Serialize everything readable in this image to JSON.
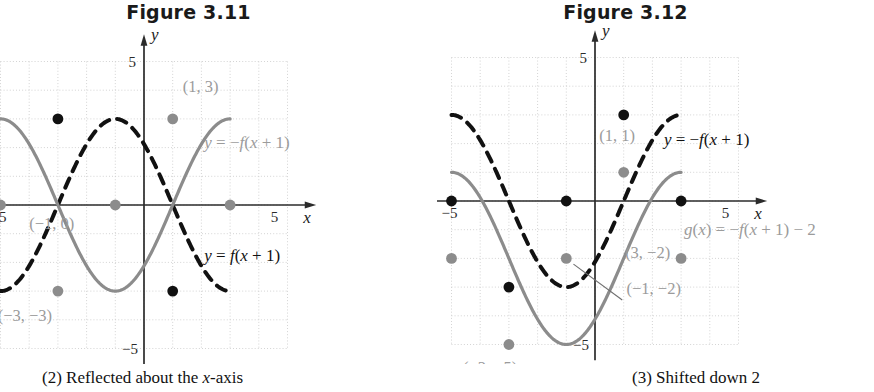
{
  "figures": [
    {
      "title": "Figure 3.11",
      "caption_prefix": "(2) Reflected about the ",
      "caption_italic": "x",
      "caption_suffix": "-axis",
      "axis": {
        "x_label": "x",
        "y_label": "y",
        "x_tick_neg": "−5",
        "x_tick_pos": "5",
        "y_tick_pos": "5",
        "y_tick_neg": "−5",
        "xmin": -6,
        "xmax": 6,
        "ymin": -6,
        "ymax": 6
      },
      "point_labels": [
        {
          "text": "(1, 3)",
          "color": "#9b9b9b",
          "x": 1.35,
          "y": 3.95
        },
        {
          "text": "(−1, 0)",
          "color": "#9b9b9b",
          "x": -4.0,
          "y": -0.85
        },
        {
          "text": "(−3, −3)",
          "color": "#9b9b9b",
          "x": -5.1,
          "y": -4.05
        }
      ],
      "equation_labels": [
        {
          "text": "y = −f(x + 1)",
          "color": "#9b9b9b",
          "x": 2.1,
          "y": 2.0
        },
        {
          "text": "y = f(x + 1)",
          "color": "#111111",
          "x": 2.1,
          "y": -1.95
        }
      ],
      "curves": [
        {
          "name": "dashed-black-curve",
          "style": "dashed",
          "color": "#111111",
          "amplitude": 3,
          "period": 8,
          "phase": -3,
          "sign": 1
        },
        {
          "name": "solid-gray-curve",
          "style": "solid",
          "color": "#8c8c8c",
          "amplitude": 3,
          "period": 8,
          "phase": -3,
          "sign": -1
        }
      ],
      "markers": [
        {
          "x": -3,
          "y": 3,
          "color": "#111111"
        },
        {
          "x": 1,
          "y": -3,
          "color": "#111111"
        },
        {
          "x": -5,
          "y": 0,
          "color": "#8c8c8c"
        },
        {
          "x": -1,
          "y": 0,
          "color": "#8c8c8c"
        },
        {
          "x": 3,
          "y": 0,
          "color": "#8c8c8c"
        },
        {
          "x": 1,
          "y": 3,
          "color": "#8c8c8c"
        },
        {
          "x": -3,
          "y": -3,
          "color": "#8c8c8c"
        }
      ]
    },
    {
      "title": "Figure 3.12",
      "caption_prefix": "(3) Shifted down 2",
      "caption_italic": "",
      "caption_suffix": "",
      "axis": {
        "x_label": "x",
        "y_label": "y",
        "x_tick_neg": "−5",
        "x_tick_pos": "5",
        "y_tick_pos": "5",
        "y_tick_neg": "−5",
        "xmin": -6,
        "xmax": 6,
        "ymin": -6,
        "ymax": 6
      },
      "point_labels": [
        {
          "text": "(1, 1)",
          "color": "#9b9b9b",
          "x": 0.15,
          "y": 2.1
        },
        {
          "text": "(3, −2)",
          "color": "#9b9b9b",
          "x": 1.05,
          "y": -2.0
        },
        {
          "text": "(−1, −2)",
          "color": "#9b9b9b",
          "x": 1.1,
          "y": -3.25
        },
        {
          "text": "(−5, −2)",
          "color": "#9b9b9b",
          "x": -7.6,
          "y": -2.65
        },
        {
          "text": "(−3, −5)",
          "color": "#9b9b9b",
          "x": -4.6,
          "y": -6.0
        }
      ],
      "equation_labels": [
        {
          "text": "y = −f(x + 1)",
          "color": "#111111",
          "x": 2.4,
          "y": 1.95
        },
        {
          "text": "g(x) = −f(x + 1) − 2",
          "color": "#9b9b9b",
          "x": 3.1,
          "y": -1.2
        }
      ],
      "curves": [
        {
          "name": "dashed-black-curve",
          "style": "dashed",
          "color": "#111111",
          "amplitude": 3,
          "period": 8,
          "phase": -3,
          "sign": -1,
          "offset": 0
        },
        {
          "name": "solid-gray-curve",
          "style": "solid",
          "color": "#8c8c8c",
          "amplitude": 3,
          "period": 8,
          "phase": -3,
          "sign": -1,
          "offset": -2
        }
      ],
      "markers": [
        {
          "x": -5,
          "y": 0,
          "color": "#111111"
        },
        {
          "x": -1,
          "y": 0,
          "color": "#111111"
        },
        {
          "x": 3,
          "y": 0,
          "color": "#111111"
        },
        {
          "x": 1,
          "y": 3,
          "color": "#111111"
        },
        {
          "x": -3,
          "y": -3,
          "color": "#111111"
        },
        {
          "x": -5,
          "y": -2,
          "color": "#8c8c8c"
        },
        {
          "x": -1,
          "y": -2,
          "color": "#8c8c8c"
        },
        {
          "x": 3,
          "y": -2,
          "color": "#8c8c8c"
        },
        {
          "x": 1,
          "y": 1,
          "color": "#8c8c8c"
        },
        {
          "x": -3,
          "y": -5,
          "color": "#8c8c8c"
        }
      ],
      "leader_line": {
        "x1": 0.95,
        "y1": -3.45,
        "x2": -0.75,
        "y2": -2.2
      }
    }
  ],
  "chart_data": {
    "type": "line",
    "panels": [
      {
        "title": "Figure 3.11",
        "caption": "(2) Reflected about the x-axis",
        "xlabel": "x",
        "ylabel": "y",
        "xlim": [
          -6,
          6
        ],
        "ylim": [
          -6,
          6
        ],
        "xticks": [
          -5,
          5
        ],
        "yticks": [
          -5,
          5
        ],
        "grid": true,
        "series": [
          {
            "name": "y = f(x + 1)",
            "style": "dashed",
            "color": "#111111",
            "equation": "y = 3*sin(pi*(x+1)/4)",
            "key_points": [
              [
                -5,
                0
              ],
              [
                -3,
                3
              ],
              [
                -1,
                0
              ],
              [
                1,
                -3
              ],
              [
                3,
                0
              ]
            ],
            "labeled_points": []
          },
          {
            "name": "y = -f(x + 1)",
            "style": "solid",
            "color": "#8c8c8c",
            "equation": "y = -3*sin(pi*(x+1)/4)",
            "key_points": [
              [
                -5,
                0
              ],
              [
                -3,
                -3
              ],
              [
                -1,
                0
              ],
              [
                1,
                3
              ],
              [
                3,
                0
              ]
            ],
            "labeled_points": [
              {
                "label": "(1, 3)",
                "x": 1,
                "y": 3
              },
              {
                "label": "(-1, 0)",
                "x": -1,
                "y": 0
              },
              {
                "label": "(-3, -3)",
                "x": -3,
                "y": -3
              }
            ]
          }
        ]
      },
      {
        "title": "Figure 3.12",
        "caption": "(3) Shifted down 2",
        "xlabel": "x",
        "ylabel": "y",
        "xlim": [
          -6,
          6
        ],
        "ylim": [
          -6,
          6
        ],
        "xticks": [
          -5,
          5
        ],
        "yticks": [
          -5,
          5
        ],
        "grid": true,
        "series": [
          {
            "name": "y = -f(x + 1)",
            "style": "dashed",
            "color": "#111111",
            "equation": "y = -3*sin(pi*(x+1)/4)",
            "key_points": [
              [
                -5,
                0
              ],
              [
                -3,
                -3
              ],
              [
                -1,
                0
              ],
              [
                1,
                3
              ],
              [
                3,
                0
              ]
            ],
            "labeled_points": []
          },
          {
            "name": "g(x) = -f(x + 1) - 2",
            "style": "solid",
            "color": "#8c8c8c",
            "equation": "y = -3*sin(pi*(x+1)/4) - 2",
            "key_points": [
              [
                -5,
                -2
              ],
              [
                -3,
                -5
              ],
              [
                -1,
                -2
              ],
              [
                1,
                1
              ],
              [
                3,
                -2
              ]
            ],
            "labeled_points": [
              {
                "label": "(1, 1)",
                "x": 1,
                "y": 1
              },
              {
                "label": "(3, -2)",
                "x": 3,
                "y": -2
              },
              {
                "label": "(-1, -2)",
                "x": -1,
                "y": -2
              },
              {
                "label": "(-5, -2)",
                "x": -5,
                "y": -2
              },
              {
                "label": "(-3, -5)",
                "x": -3,
                "y": -5
              }
            ]
          }
        ]
      }
    ]
  }
}
